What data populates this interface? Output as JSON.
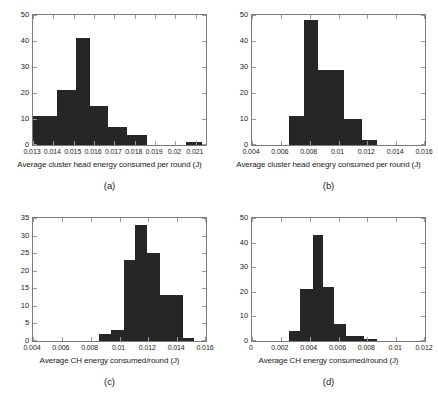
{
  "figure": {
    "background": "#ffffff",
    "bar_color": "#262626",
    "axis_color": "#7a7a7a"
  },
  "panels": [
    {
      "id": "a",
      "caption": "(a)",
      "xlabel": "Average cluster head energy consumed per round (J)",
      "ylabel": "",
      "xticks": [
        "0.013",
        "0.014",
        "0.015",
        "0.016",
        "0.017",
        "0.018",
        "0.019",
        "0.02",
        "0.021"
      ],
      "yticks": [
        "0",
        "10",
        "20",
        "30",
        "40",
        "50"
      ]
    },
    {
      "id": "b",
      "caption": "(b)",
      "xlabel": "Average cluster head enegry consumed per round (J)",
      "ylabel": "",
      "xticks": [
        "0.004",
        "0.006",
        "0.008",
        "0.01",
        "0.012",
        "0.014",
        "0.016"
      ],
      "yticks": [
        "0",
        "10",
        "20",
        "30",
        "40",
        "50"
      ]
    },
    {
      "id": "c",
      "caption": "(c)",
      "xlabel": "Average CH energy consumed/round (J)",
      "ylabel": "",
      "xticks": [
        "0.004",
        "0.006",
        "0.008",
        "0.01",
        "0.012",
        "0.014",
        "0.016"
      ],
      "yticks": [
        "0",
        "5",
        "10",
        "15",
        "20",
        "25",
        "30",
        "35"
      ]
    },
    {
      "id": "d",
      "caption": "(d)",
      "xlabel": "Average CH energy consumed/round (J)",
      "ylabel": "",
      "xticks": [
        "0",
        "0.002",
        "0.004",
        "0.006",
        "0.008",
        "0.01",
        "0.012"
      ],
      "yticks": [
        "0",
        "10",
        "20",
        "30",
        "40",
        "50"
      ]
    }
  ],
  "chart_data": [
    {
      "type": "bar",
      "panel": "a",
      "title": "",
      "xlabel": "Average cluster head energy consumed per round (J)",
      "ylabel": "",
      "xlim": [
        0.013,
        0.0215
      ],
      "ylim": [
        0,
        50
      ],
      "xticks": [
        0.013,
        0.014,
        0.015,
        0.016,
        0.017,
        0.018,
        0.019,
        0.02,
        0.021
      ],
      "yticks": [
        0,
        10,
        20,
        30,
        40,
        50
      ],
      "grid": false,
      "legend": null,
      "bin_edges": [
        0.013,
        0.0142,
        0.0151,
        0.0158,
        0.0167,
        0.0176,
        0.0186,
        0.02,
        0.0205,
        0.0213
      ],
      "bin_centers": [
        0.0136,
        0.01465,
        0.01545,
        0.01625,
        0.01715,
        0.0181,
        0.0193,
        0.02025,
        0.0209
      ],
      "values": [
        11,
        21,
        41,
        15,
        7,
        4,
        0,
        0,
        1
      ]
    },
    {
      "type": "bar",
      "panel": "b",
      "title": "",
      "xlabel": "Average cluster head enegry consumed per round (J)",
      "ylabel": "",
      "xlim": [
        0.004,
        0.016
      ],
      "ylim": [
        0,
        50
      ],
      "xticks": [
        0.004,
        0.006,
        0.008,
        0.01,
        0.012,
        0.014,
        0.016
      ],
      "yticks": [
        0,
        10,
        20,
        30,
        40,
        50
      ],
      "grid": false,
      "legend": null,
      "bin_edges": [
        0.0066,
        0.0076,
        0.0086,
        0.0104,
        0.0116,
        0.0127
      ],
      "bin_centers": [
        0.0071,
        0.0081,
        0.0095,
        0.011,
        0.01215
      ],
      "values": [
        11,
        48,
        29,
        10,
        2
      ]
    },
    {
      "type": "bar",
      "panel": "c",
      "title": "",
      "xlabel": "Average CH energy consumed/round (J)",
      "ylabel": "",
      "xlim": [
        0.004,
        0.016
      ],
      "ylim": [
        0,
        35
      ],
      "xticks": [
        0.004,
        0.006,
        0.008,
        0.01,
        0.012,
        0.014,
        0.016
      ],
      "yticks": [
        0,
        5,
        10,
        15,
        20,
        25,
        30,
        35
      ],
      "grid": false,
      "legend": null,
      "bin_edges": [
        0.0086,
        0.0094,
        0.0103,
        0.0111,
        0.0119,
        0.0128,
        0.0144,
        0.0152
      ],
      "bin_centers": [
        0.009,
        0.00985,
        0.0107,
        0.0115,
        0.01235,
        0.0136,
        0.0148
      ],
      "values": [
        2,
        3,
        23,
        33,
        25,
        13,
        1
      ]
    },
    {
      "type": "bar",
      "panel": "d",
      "title": "",
      "xlabel": "Average CH energy consumed/round (J)",
      "ylabel": "",
      "xlim": [
        0,
        0.012
      ],
      "ylim": [
        0,
        50
      ],
      "xticks": [
        0,
        0.002,
        0.004,
        0.006,
        0.008,
        0.01,
        0.012
      ],
      "yticks": [
        0,
        10,
        20,
        30,
        40,
        50
      ],
      "grid": false,
      "legend": null,
      "bin_edges": [
        0.0026,
        0.0033,
        0.0042,
        0.0049,
        0.0057,
        0.0065,
        0.0078,
        0.0087,
        0.0096
      ],
      "bin_centers": [
        0.00295,
        0.00375,
        0.00455,
        0.0053,
        0.0061,
        0.00715,
        0.00825,
        0.00915
      ],
      "values": [
        4,
        21,
        43,
        22,
        7,
        2,
        1,
        0
      ]
    }
  ]
}
